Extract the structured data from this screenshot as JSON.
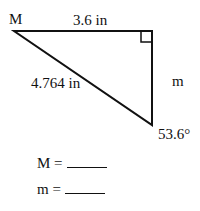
{
  "diagram": {
    "type": "right-triangle",
    "vertex_label": "M",
    "top_side_label": "3.6 in",
    "hypotenuse_label": "4.764 in",
    "right_side_label": "m",
    "angle_label": "53.6°"
  },
  "questions": [
    {
      "label": "M =",
      "answer": ""
    },
    {
      "label": "m =",
      "answer": ""
    }
  ],
  "colors": {
    "line": "#111111",
    "background": "#ffffff"
  }
}
